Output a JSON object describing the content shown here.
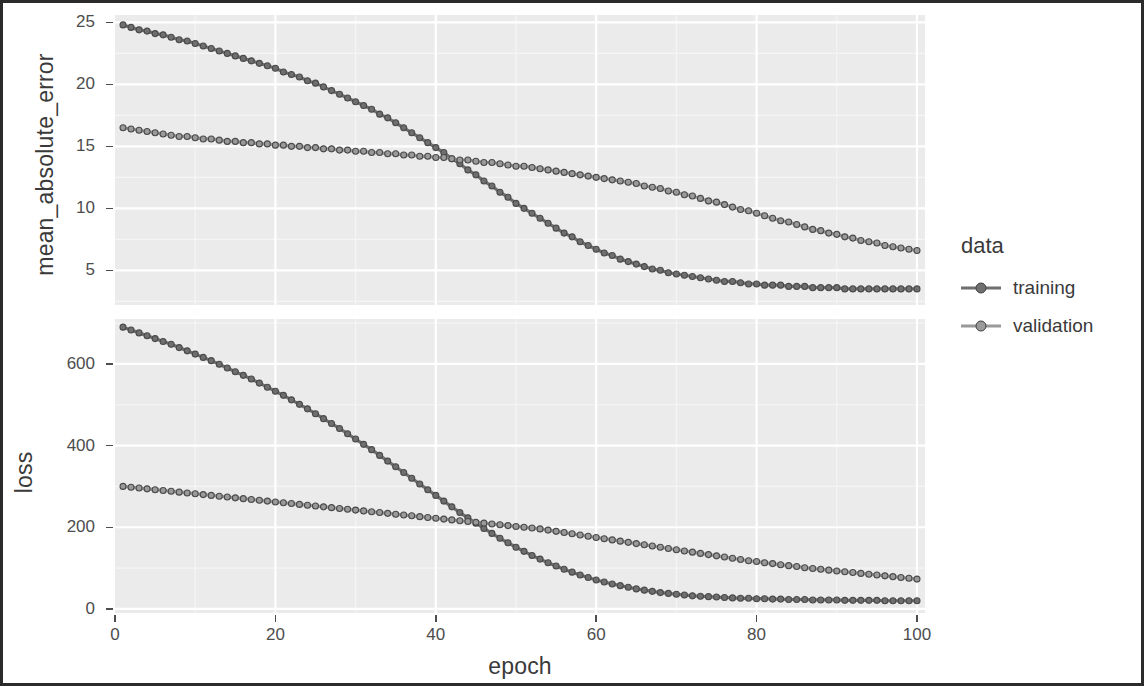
{
  "legend": {
    "title": "data",
    "entries": [
      {
        "label": "training",
        "color": "#6f6f6f"
      },
      {
        "label": "validation",
        "color": "#9a9a9a"
      }
    ]
  },
  "style": {
    "panel_background": "#ebebeb",
    "grid_major": "#ffffff",
    "grid_minor": "#f5f5f5",
    "text": "#3a3a3a",
    "frame_border": "#2b2b2b"
  },
  "chart_data": [
    {
      "type": "line",
      "title": "",
      "xlabel": "epoch",
      "ylabel": "mean_absolute_error",
      "xlim": [
        0,
        101
      ],
      "ylim": [
        2.2,
        25.6
      ],
      "xticks": [
        0,
        20,
        40,
        60,
        80,
        100
      ],
      "xticklabels": [
        "0",
        "20",
        "40",
        "60",
        "80",
        "100"
      ],
      "yticks": [
        5,
        10,
        15,
        20,
        25
      ],
      "yticklabels": [
        "5",
        "10",
        "15",
        "20",
        "25"
      ],
      "grid": true,
      "legend_position": "right",
      "x": [
        1,
        2,
        3,
        4,
        5,
        6,
        7,
        8,
        9,
        10,
        11,
        12,
        13,
        14,
        15,
        16,
        17,
        18,
        19,
        20,
        21,
        22,
        23,
        24,
        25,
        26,
        27,
        28,
        29,
        30,
        31,
        32,
        33,
        34,
        35,
        36,
        37,
        38,
        39,
        40,
        41,
        42,
        43,
        44,
        45,
        46,
        47,
        48,
        49,
        50,
        51,
        52,
        53,
        54,
        55,
        56,
        57,
        58,
        59,
        60,
        61,
        62,
        63,
        64,
        65,
        66,
        67,
        68,
        69,
        70,
        71,
        72,
        73,
        74,
        75,
        76,
        77,
        78,
        79,
        80,
        81,
        82,
        83,
        84,
        85,
        86,
        87,
        88,
        89,
        90,
        91,
        92,
        93,
        94,
        95,
        96,
        97,
        98,
        99,
        100
      ],
      "series": [
        {
          "name": "training",
          "values": [
            24.8,
            24.6,
            24.4,
            24.3,
            24.1,
            24.0,
            23.8,
            23.6,
            23.5,
            23.3,
            23.1,
            22.9,
            22.7,
            22.5,
            22.3,
            22.1,
            21.9,
            21.7,
            21.5,
            21.3,
            21.0,
            20.8,
            20.6,
            20.3,
            20.1,
            19.8,
            19.5,
            19.2,
            18.9,
            18.6,
            18.3,
            18.0,
            17.6,
            17.3,
            16.9,
            16.5,
            16.1,
            15.7,
            15.3,
            14.9,
            14.5,
            14.0,
            13.6,
            13.1,
            12.7,
            12.2,
            11.8,
            11.3,
            10.9,
            10.4,
            10.0,
            9.6,
            9.2,
            8.8,
            8.4,
            8.0,
            7.7,
            7.3,
            7.0,
            6.7,
            6.4,
            6.2,
            5.9,
            5.7,
            5.5,
            5.3,
            5.1,
            5.0,
            4.8,
            4.7,
            4.6,
            4.5,
            4.4,
            4.3,
            4.2,
            4.1,
            4.1,
            4.0,
            3.9,
            3.9,
            3.8,
            3.8,
            3.8,
            3.7,
            3.7,
            3.7,
            3.6,
            3.6,
            3.6,
            3.6,
            3.5,
            3.5,
            3.5,
            3.5,
            3.5,
            3.5,
            3.5,
            3.5,
            3.5,
            3.5
          ]
        },
        {
          "name": "validation",
          "values": [
            16.5,
            16.4,
            16.3,
            16.2,
            16.1,
            16.0,
            15.9,
            15.8,
            15.8,
            15.7,
            15.6,
            15.6,
            15.5,
            15.4,
            15.4,
            15.3,
            15.3,
            15.2,
            15.2,
            15.1,
            15.1,
            15.0,
            15.0,
            14.9,
            14.9,
            14.8,
            14.8,
            14.7,
            14.7,
            14.6,
            14.6,
            14.5,
            14.5,
            14.4,
            14.4,
            14.3,
            14.3,
            14.2,
            14.2,
            14.1,
            14.1,
            14.0,
            13.9,
            13.9,
            13.8,
            13.7,
            13.7,
            13.6,
            13.5,
            13.4,
            13.4,
            13.3,
            13.2,
            13.1,
            13.0,
            12.9,
            12.8,
            12.7,
            12.6,
            12.5,
            12.4,
            12.3,
            12.2,
            12.1,
            12.0,
            11.8,
            11.7,
            11.6,
            11.4,
            11.3,
            11.1,
            11.0,
            10.8,
            10.6,
            10.5,
            10.3,
            10.1,
            9.9,
            9.8,
            9.6,
            9.4,
            9.2,
            9.0,
            8.9,
            8.7,
            8.5,
            8.3,
            8.2,
            8.0,
            7.9,
            7.7,
            7.6,
            7.4,
            7.3,
            7.2,
            7.0,
            6.9,
            6.8,
            6.7,
            6.6
          ]
        }
      ]
    },
    {
      "type": "line",
      "title": "",
      "xlabel": "epoch",
      "ylabel": "loss",
      "xlim": [
        0,
        101
      ],
      "ylim": [
        -10,
        710
      ],
      "xticks": [
        0,
        20,
        40,
        60,
        80,
        100
      ],
      "xticklabels": [
        "0",
        "20",
        "40",
        "60",
        "80",
        "100"
      ],
      "yticks": [
        0,
        200,
        400,
        600
      ],
      "yticklabels": [
        "0",
        "200",
        "400",
        "600"
      ],
      "grid": true,
      "legend_position": "right",
      "x": [
        1,
        2,
        3,
        4,
        5,
        6,
        7,
        8,
        9,
        10,
        11,
        12,
        13,
        14,
        15,
        16,
        17,
        18,
        19,
        20,
        21,
        22,
        23,
        24,
        25,
        26,
        27,
        28,
        29,
        30,
        31,
        32,
        33,
        34,
        35,
        36,
        37,
        38,
        39,
        40,
        41,
        42,
        43,
        44,
        45,
        46,
        47,
        48,
        49,
        50,
        51,
        52,
        53,
        54,
        55,
        56,
        57,
        58,
        59,
        60,
        61,
        62,
        63,
        64,
        65,
        66,
        67,
        68,
        69,
        70,
        71,
        72,
        73,
        74,
        75,
        76,
        77,
        78,
        79,
        80,
        81,
        82,
        83,
        84,
        85,
        86,
        87,
        88,
        89,
        90,
        91,
        92,
        93,
        94,
        95,
        96,
        97,
        98,
        99,
        100
      ],
      "series": [
        {
          "name": "training",
          "values": [
            690,
            683,
            676,
            669,
            662,
            655,
            648,
            640,
            632,
            624,
            616,
            608,
            599,
            590,
            581,
            572,
            563,
            553,
            543,
            533,
            523,
            512,
            501,
            490,
            478,
            466,
            454,
            442,
            429,
            416,
            403,
            390,
            376,
            362,
            348,
            334,
            320,
            306,
            292,
            278,
            264,
            250,
            236,
            223,
            210,
            197,
            185,
            173,
            162,
            151,
            141,
            131,
            122,
            113,
            105,
            97,
            90,
            83,
            77,
            71,
            66,
            61,
            57,
            53,
            49,
            46,
            43,
            40,
            38,
            36,
            34,
            32,
            31,
            30,
            29,
            28,
            27,
            26,
            26,
            25,
            25,
            24,
            24,
            23,
            23,
            23,
            22,
            22,
            22,
            22,
            21,
            21,
            21,
            21,
            21,
            20,
            20,
            20,
            20,
            20
          ]
        },
        {
          "name": "validation",
          "values": [
            300,
            298,
            296,
            294,
            292,
            290,
            288,
            286,
            284,
            282,
            280,
            278,
            276,
            274,
            272,
            270,
            268,
            266,
            264,
            262,
            260,
            258,
            256,
            254,
            252,
            250,
            248,
            246,
            244,
            242,
            240,
            238,
            236,
            234,
            232,
            230,
            228,
            226,
            224,
            222,
            220,
            218,
            216,
            214,
            212,
            210,
            208,
            206,
            204,
            202,
            200,
            198,
            196,
            193,
            190,
            187,
            184,
            181,
            178,
            175,
            172,
            169,
            166,
            163,
            160,
            157,
            154,
            151,
            148,
            145,
            142,
            139,
            136,
            133,
            130,
            127,
            124,
            121,
            118,
            116,
            113,
            111,
            108,
            106,
            104,
            101,
            99,
            97,
            95,
            93,
            91,
            89,
            87,
            85,
            83,
            81,
            79,
            77,
            75,
            73
          ]
        }
      ]
    }
  ]
}
